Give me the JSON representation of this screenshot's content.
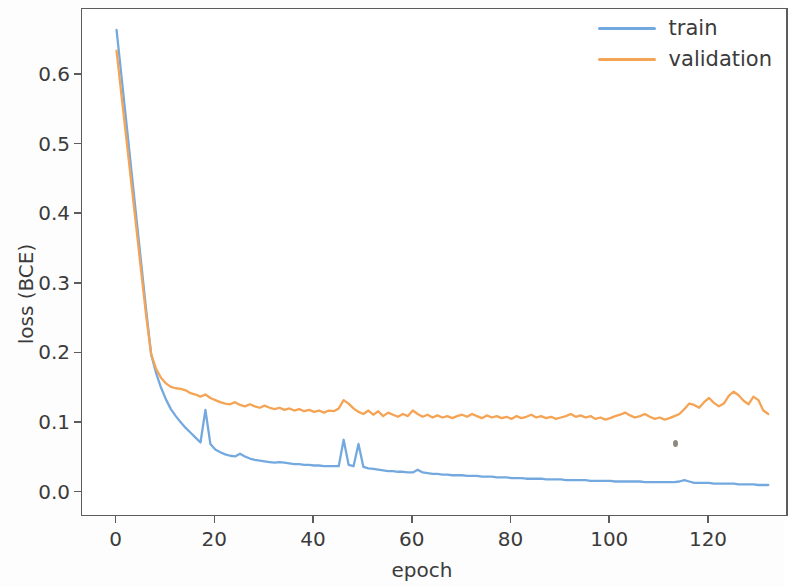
{
  "chart_data": {
    "type": "line",
    "title": "",
    "xlabel": "epoch",
    "ylabel": "loss (BCE)",
    "xlim": [
      -7,
      136
    ],
    "ylim": [
      -0.035,
      0.695
    ],
    "xticks": [
      0,
      20,
      40,
      60,
      80,
      100,
      120
    ],
    "xtick_labels": [
      "0",
      "20",
      "40",
      "60",
      "80",
      "100",
      "120"
    ],
    "yticks": [
      0.0,
      0.1,
      0.2,
      0.3,
      0.4,
      0.5,
      0.6
    ],
    "ytick_labels": [
      "0.0",
      "0.1",
      "0.2",
      "0.3",
      "0.4",
      "0.5",
      "0.6"
    ],
    "grid": false,
    "legend_position": "upper right",
    "series": [
      {
        "name": "train",
        "color": "#74a9e0",
        "x": [
          0,
          1,
          2,
          3,
          4,
          5,
          6,
          7,
          8,
          9,
          10,
          11,
          12,
          13,
          14,
          15,
          16,
          17,
          18,
          19,
          20,
          21,
          22,
          23,
          24,
          25,
          26,
          27,
          28,
          29,
          30,
          31,
          32,
          33,
          34,
          35,
          36,
          37,
          38,
          39,
          40,
          41,
          42,
          43,
          44,
          45,
          46,
          47,
          48,
          49,
          50,
          51,
          52,
          53,
          54,
          55,
          56,
          57,
          58,
          59,
          60,
          61,
          62,
          63,
          64,
          65,
          66,
          67,
          68,
          69,
          70,
          71,
          72,
          73,
          74,
          75,
          76,
          77,
          78,
          79,
          80,
          81,
          82,
          83,
          84,
          85,
          86,
          87,
          88,
          89,
          90,
          91,
          92,
          93,
          94,
          95,
          96,
          97,
          98,
          99,
          100,
          101,
          102,
          103,
          104,
          105,
          106,
          107,
          108,
          109,
          110,
          111,
          112,
          113,
          114,
          115,
          116,
          117,
          118,
          119,
          120,
          121,
          122,
          123,
          124,
          125,
          126,
          127,
          128,
          129,
          130,
          131,
          132
        ],
        "values": [
          0.665,
          0.598,
          0.531,
          0.463,
          0.396,
          0.329,
          0.262,
          0.199,
          0.172,
          0.151,
          0.134,
          0.12,
          0.11,
          0.101,
          0.093,
          0.086,
          0.079,
          0.072,
          0.119,
          0.07,
          0.062,
          0.058,
          0.055,
          0.053,
          0.052,
          0.056,
          0.052,
          0.049,
          0.047,
          0.046,
          0.045,
          0.044,
          0.043,
          0.044,
          0.043,
          0.042,
          0.041,
          0.041,
          0.04,
          0.04,
          0.039,
          0.039,
          0.038,
          0.038,
          0.038,
          0.038,
          0.076,
          0.04,
          0.038,
          0.07,
          0.037,
          0.035,
          0.034,
          0.033,
          0.032,
          0.031,
          0.031,
          0.03,
          0.03,
          0.029,
          0.029,
          0.033,
          0.029,
          0.028,
          0.027,
          0.027,
          0.026,
          0.026,
          0.025,
          0.025,
          0.025,
          0.024,
          0.024,
          0.024,
          0.023,
          0.023,
          0.023,
          0.022,
          0.022,
          0.022,
          0.021,
          0.021,
          0.021,
          0.02,
          0.02,
          0.02,
          0.02,
          0.019,
          0.019,
          0.019,
          0.019,
          0.018,
          0.018,
          0.018,
          0.018,
          0.018,
          0.017,
          0.017,
          0.017,
          0.017,
          0.017,
          0.016,
          0.016,
          0.016,
          0.016,
          0.016,
          0.016,
          0.015,
          0.015,
          0.015,
          0.015,
          0.015,
          0.015,
          0.015,
          0.016,
          0.018,
          0.016,
          0.014,
          0.014,
          0.014,
          0.014,
          0.013,
          0.013,
          0.013,
          0.013,
          0.013,
          0.012,
          0.012,
          0.012,
          0.012,
          0.011,
          0.011,
          0.011
        ]
      },
      {
        "name": "validation",
        "color": "#f5a455",
        "x": [
          0,
          1,
          2,
          3,
          4,
          5,
          6,
          7,
          8,
          9,
          10,
          11,
          12,
          13,
          14,
          15,
          16,
          17,
          18,
          19,
          20,
          21,
          22,
          23,
          24,
          25,
          26,
          27,
          28,
          29,
          30,
          31,
          32,
          33,
          34,
          35,
          36,
          37,
          38,
          39,
          40,
          41,
          42,
          43,
          44,
          45,
          46,
          47,
          48,
          49,
          50,
          51,
          52,
          53,
          54,
          55,
          56,
          57,
          58,
          59,
          60,
          61,
          62,
          63,
          64,
          65,
          66,
          67,
          68,
          69,
          70,
          71,
          72,
          73,
          74,
          75,
          76,
          77,
          78,
          79,
          80,
          81,
          82,
          83,
          84,
          85,
          86,
          87,
          88,
          89,
          90,
          91,
          92,
          93,
          94,
          95,
          96,
          97,
          98,
          99,
          100,
          101,
          102,
          103,
          104,
          105,
          106,
          107,
          108,
          109,
          110,
          111,
          112,
          113,
          114,
          115,
          116,
          117,
          118,
          119,
          120,
          121,
          122,
          123,
          124,
          125,
          126,
          127,
          128,
          129,
          130,
          131,
          132
        ],
        "values": [
          0.635,
          0.571,
          0.508,
          0.444,
          0.381,
          0.317,
          0.254,
          0.199,
          0.178,
          0.165,
          0.157,
          0.152,
          0.15,
          0.149,
          0.147,
          0.143,
          0.141,
          0.138,
          0.141,
          0.136,
          0.133,
          0.13,
          0.128,
          0.127,
          0.13,
          0.126,
          0.124,
          0.127,
          0.124,
          0.122,
          0.125,
          0.122,
          0.12,
          0.122,
          0.119,
          0.121,
          0.118,
          0.12,
          0.117,
          0.119,
          0.116,
          0.118,
          0.115,
          0.118,
          0.117,
          0.121,
          0.133,
          0.128,
          0.121,
          0.116,
          0.113,
          0.118,
          0.112,
          0.117,
          0.11,
          0.115,
          0.112,
          0.109,
          0.113,
          0.11,
          0.118,
          0.113,
          0.109,
          0.112,
          0.108,
          0.111,
          0.108,
          0.11,
          0.107,
          0.11,
          0.112,
          0.109,
          0.113,
          0.11,
          0.107,
          0.111,
          0.108,
          0.11,
          0.107,
          0.109,
          0.106,
          0.11,
          0.107,
          0.109,
          0.112,
          0.108,
          0.11,
          0.107,
          0.109,
          0.106,
          0.108,
          0.11,
          0.113,
          0.109,
          0.111,
          0.108,
          0.11,
          0.106,
          0.108,
          0.105,
          0.107,
          0.11,
          0.112,
          0.115,
          0.111,
          0.108,
          0.11,
          0.113,
          0.109,
          0.106,
          0.108,
          0.105,
          0.107,
          0.11,
          0.113,
          0.12,
          0.128,
          0.126,
          0.122,
          0.13,
          0.136,
          0.129,
          0.124,
          0.128,
          0.139,
          0.145,
          0.14,
          0.132,
          0.127,
          0.138,
          0.133,
          0.118,
          0.113
        ]
      }
    ]
  },
  "legend": {
    "entries": [
      {
        "label": "train",
        "color": "#74a9e0"
      },
      {
        "label": "validation",
        "color": "#f5a455"
      }
    ]
  }
}
